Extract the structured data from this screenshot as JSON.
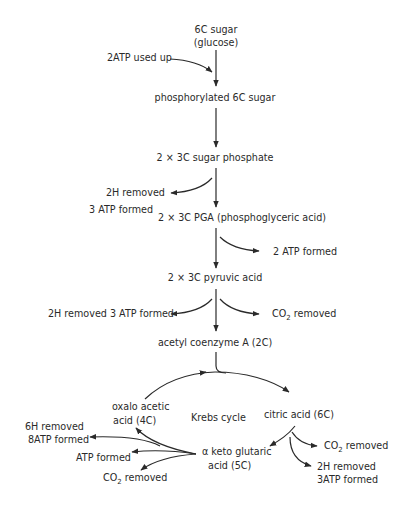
{
  "diagram": {
    "colors": {
      "line": "#2a2a2a",
      "text": "#2a2a2a",
      "background": "#ffffff"
    },
    "main_chain": {
      "glucose_line1": "6C sugar",
      "glucose_line2": "(glucose)",
      "phosphorylated": "phosphorylated 6C sugar",
      "sugar_phosphate": "2 × 3C sugar phosphate",
      "pga": "2 × 3C PGA (phosphoglyceric acid)",
      "pyruvic": "2 × 3C pyruvic acid",
      "acetyl": "acetyl coenzyme A (2C)"
    },
    "side_labels": {
      "atp_used": "2ATP used up",
      "h_removed_1": "2H removed",
      "atp_formed_1": "3 ATP formed",
      "atp_formed_2": "2 ATP formed",
      "h_atp_pyruvic": "2H removed 3 ATP formed",
      "co2_pyruvic_prefix": "CO",
      "co2_pyruvic_sub": "2",
      "co2_pyruvic_suffix": " removed"
    },
    "krebs": {
      "cycle_label": "Krebs cycle",
      "oxalo_line1": "oxalo acetic",
      "oxalo_line2": "acid (4C)",
      "citric": "citric acid (6C)",
      "keto_line1": "α keto glutaric",
      "keto_line2": "acid (5C)",
      "citric_co2_prefix": "CO",
      "citric_co2_sub": "2",
      "citric_co2_suffix": " removed",
      "citric_h_line1": "2H removed",
      "citric_h_line2": "3ATP formed",
      "keto_h_line1": "6H removed",
      "keto_h_line2": "8ATP formed",
      "keto_atp": "ATP formed",
      "keto_co2_prefix": "CO",
      "keto_co2_sub": "2",
      "keto_co2_suffix": " removed"
    }
  }
}
